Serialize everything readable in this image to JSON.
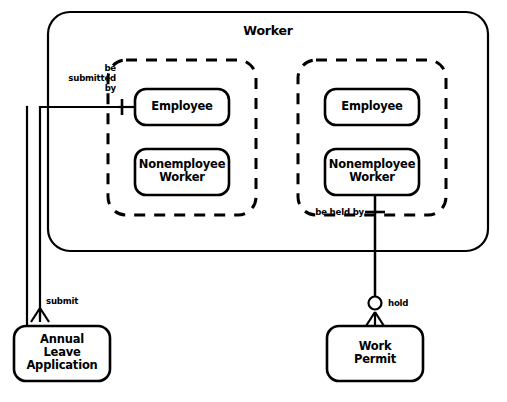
{
  "figure": {
    "title": "Worker",
    "caption": "",
    "stroke_color": "#000000",
    "fill_color": "#ffffff",
    "background": "#ffffff"
  },
  "outer_container": {
    "name": "Worker",
    "label": "Worker",
    "border_style": "solid",
    "shape": "rounded-rectangle"
  },
  "subtype_groups": [
    {
      "id": "left-group",
      "border_style": "dashed",
      "entities": [
        {
          "id": "left-employee",
          "label": "Employee"
        },
        {
          "id": "left-nonemployee",
          "label": "Nonemployee\nWorker"
        }
      ]
    },
    {
      "id": "right-group",
      "border_style": "dashed",
      "entities": [
        {
          "id": "right-employee",
          "label": "Employee"
        },
        {
          "id": "right-nonemployee",
          "label": "Nonemployee\nWorker"
        }
      ]
    }
  ],
  "external_entities": [
    {
      "id": "annual-leave-application",
      "label": "Annual\nLeave\nApplication"
    },
    {
      "id": "work-permit",
      "label": "Work\nPermit"
    }
  ],
  "relationships": [
    {
      "id": "be-submitted-by",
      "label": "be\nsubmitted\nby",
      "from": "annual-leave-application",
      "to": "left-employee",
      "cardinality_at_target": "one",
      "cardinality_at_source": "many"
    },
    {
      "id": "submit",
      "label": "submit",
      "from": "left-employee",
      "to": "annual-leave-application",
      "cardinality_at_target": "many"
    },
    {
      "id": "be-held-by",
      "label": "be held by",
      "from": "work-permit",
      "to": "right-nonemployee",
      "cardinality_at_target": "one"
    },
    {
      "id": "hold",
      "label": "hold",
      "from": "right-nonemployee",
      "to": "work-permit",
      "cardinality_at_target": "zero-or-many"
    }
  ],
  "notation": {
    "one_symbol": "crossbar",
    "many_symbol": "crow-foot",
    "zero_symbol": "circle"
  }
}
